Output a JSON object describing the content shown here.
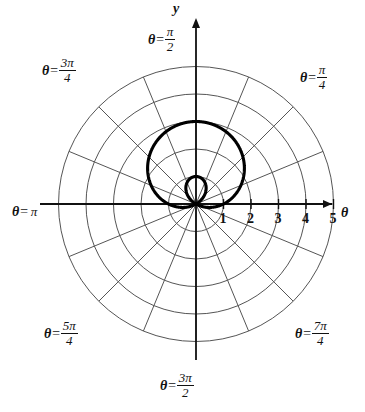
{
  "figure": {
    "kind": "polar-plot",
    "background_color": "#ffffff",
    "grid_color": "#555555",
    "axis_color": "#111111",
    "curve_color": "#000000",
    "origin": {
      "x": 196,
      "y": 204
    },
    "unit_px": 27.5
  },
  "axes": {
    "y_axis_label": "y",
    "theta_axis_label": "θ",
    "x_ticks": [
      "1",
      "2",
      "3",
      "4",
      "5"
    ],
    "x_tick_values": [
      1,
      2,
      3,
      4,
      5
    ]
  },
  "angle_labels": [
    {
      "name": "pi-over-2",
      "theta": "θ",
      "eq": "=",
      "num": "π",
      "den": "2",
      "text": "θ = π/2"
    },
    {
      "name": "pi-over-4",
      "theta": "θ",
      "eq": "=",
      "num": "π",
      "den": "4",
      "text": "θ = π/4"
    },
    {
      "name": "3pi-over-4",
      "theta": "θ",
      "eq": "=",
      "num": "3π",
      "den": "4",
      "text": "θ = 3π/4"
    },
    {
      "name": "pi",
      "theta": "θ",
      "eq": "=",
      "num": "π",
      "den": "",
      "text": "θ = π"
    },
    {
      "name": "5pi-over-4",
      "theta": "θ",
      "eq": "=",
      "num": "5π",
      "den": "4",
      "text": "θ = 5π/4"
    },
    {
      "name": "7pi-over-4",
      "theta": "θ",
      "eq": "=",
      "num": "7π",
      "den": "4",
      "text": "θ = 7π/4"
    },
    {
      "name": "3pi-over-2",
      "theta": "θ",
      "eq": "=",
      "num": "3π",
      "den": "2",
      "text": "θ = 3π/2"
    }
  ],
  "chart_data": {
    "type": "line",
    "subtype": "polar",
    "title": "",
    "xlabel": "θ",
    "ylabel": "y",
    "grid": true,
    "legend": "none",
    "polar_grid": {
      "radial_circles": [
        1,
        2,
        3,
        4,
        5
      ],
      "radial_circle_count": 5,
      "spoke_count": 16,
      "spoke_step_rad": 0.39269908
    },
    "axis_ticks": {
      "x": [
        1,
        2,
        3,
        4,
        5
      ]
    },
    "rlim": [
      0,
      5
    ],
    "series": [
      {
        "name": "limacon",
        "equation": "r = 1 + 2 sin(θ)",
        "a": 1,
        "b": 2,
        "orientation": "sin",
        "r_max": 3,
        "inner_loop": true,
        "inner_loop_r_min": -1,
        "zero_crossings_rad": [
          3.66519143,
          5.75958653
        ],
        "points_rtheta": [
          [
            3.0,
            1.5708
          ],
          [
            2.932,
            1.309
          ],
          [
            2.732,
            1.0472
          ],
          [
            2.414,
            0.7854
          ],
          [
            2.0,
            0.5236
          ],
          [
            1.518,
            0.2618
          ],
          [
            1.0,
            0.0
          ],
          [
            0.482,
            -0.2618
          ],
          [
            0.0,
            -0.5236
          ],
          [
            -0.414,
            -0.7854
          ],
          [
            -0.732,
            -1.0472
          ],
          [
            -0.932,
            -1.309
          ],
          [
            -1.0,
            -1.5708
          ],
          [
            -0.932,
            -1.8326
          ],
          [
            -0.732,
            -2.0944
          ],
          [
            -0.414,
            -2.3562
          ],
          [
            0.0,
            -2.618
          ],
          [
            0.482,
            -2.8798
          ],
          [
            1.0,
            3.1416
          ],
          [
            1.518,
            2.8798
          ],
          [
            2.0,
            2.618
          ],
          [
            2.414,
            2.3562
          ],
          [
            2.732,
            2.0944
          ],
          [
            2.932,
            1.8326
          ]
        ]
      }
    ]
  }
}
